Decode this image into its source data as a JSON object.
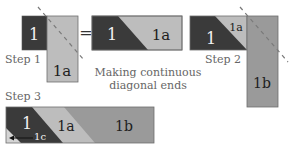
{
  "title": "Making continuous diagonal ends",
  "caption_line1": "Making continuous",
  "caption_line2": "diagonal ends",
  "colors": {
    "piece_1": "#3a3a3a",
    "piece_1a": "#bdbdbd",
    "piece_1b": "#9a9a9a",
    "piece_1c": "#d4d4d4",
    "outline": "#6e6e6e",
    "dashed_line": "#7a7a7a"
  },
  "step1": {
    "label": "Step 1",
    "piece_1": "1",
    "piece_1a": "1a",
    "equals": "="
  },
  "result1": {
    "piece_1": "1",
    "piece_1a": "1a"
  },
  "step2": {
    "label": "Step 2",
    "piece_1": "1",
    "piece_1a": "1a",
    "piece_1b": "1b"
  },
  "step3": {
    "label": "Step 3",
    "piece_1": "1",
    "piece_1a": "1a",
    "piece_1b": "1b",
    "piece_1c": "1c"
  }
}
